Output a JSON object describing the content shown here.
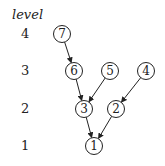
{
  "diagram": {
    "axis_title": "level",
    "levels": [
      {
        "label": "4",
        "y": 34
      },
      {
        "label": "3",
        "y": 71
      },
      {
        "label": "2",
        "y": 109
      },
      {
        "label": "1",
        "y": 146
      }
    ],
    "nodes": [
      {
        "id": "7",
        "label": "7",
        "level": 4,
        "x": 62,
        "y": 34
      },
      {
        "id": "6",
        "label": "6",
        "level": 3,
        "x": 74,
        "y": 71
      },
      {
        "id": "5",
        "label": "5",
        "level": 3,
        "x": 110,
        "y": 71
      },
      {
        "id": "4",
        "label": "4",
        "level": 3,
        "x": 146,
        "y": 71
      },
      {
        "id": "3",
        "label": "3",
        "level": 2,
        "x": 84,
        "y": 109
      },
      {
        "id": "2",
        "label": "2",
        "level": 2,
        "x": 116,
        "y": 109
      },
      {
        "id": "1",
        "label": "1",
        "level": 1,
        "x": 94,
        "y": 146
      }
    ],
    "edges": [
      {
        "from": "7",
        "to": "6"
      },
      {
        "from": "6",
        "to": "3"
      },
      {
        "from": "5",
        "to": "3"
      },
      {
        "from": "4",
        "to": "2"
      },
      {
        "from": "3",
        "to": "1"
      },
      {
        "from": "2",
        "to": "1"
      }
    ]
  }
}
